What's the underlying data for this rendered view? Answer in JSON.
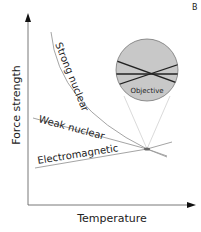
{
  "panel_label": "B",
  "axes": {
    "x_label": "Temperature",
    "y_label": "Force strength"
  },
  "curves": [
    {
      "name": "strong-nuclear",
      "label": "Strong nuclear"
    },
    {
      "name": "weak-nuclear",
      "label": "Weak nuclear"
    },
    {
      "name": "electromagnetic",
      "label": "Electromagnetic"
    }
  ],
  "inset": {
    "label": "Objective",
    "fill_color": "#c8c8c8"
  },
  "colors": {
    "axis": "#333333",
    "curve": "#9a9a9a",
    "inset_lines": "#222222",
    "zoom_lines": "#c8c8c8"
  }
}
